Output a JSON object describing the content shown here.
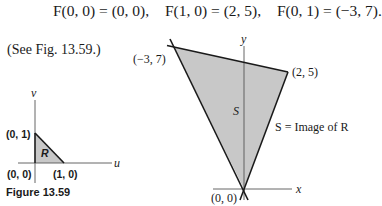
{
  "equations": [
    {
      "text": "F(0, 0) = (0, 0),"
    },
    {
      "text": "F(1, 0) = (2, 5),"
    },
    {
      "text": "F(0, 1) = (−3, 7)."
    }
  ],
  "reference_text": "(See Fig. 13.59.)",
  "figure_left": {
    "axis_labels": {
      "vertical": "v",
      "horizontal": "u"
    },
    "region_label": "R",
    "points": [
      {
        "label": "(0, 1)"
      },
      {
        "label": "(0, 0)"
      },
      {
        "label": "(1, 0)"
      }
    ],
    "caption": "Figure 13.59",
    "fill_color": "#c8c8c8"
  },
  "figure_right": {
    "axis_labels": {
      "vertical": "y",
      "horizontal": "x"
    },
    "region_label": "S",
    "annotation": "S = Image of R",
    "points": [
      {
        "label": "(−3, 7)"
      },
      {
        "label": "(2, 5)"
      },
      {
        "label": "(0, 0)"
      }
    ],
    "fill_color": "#c8c8c8"
  }
}
